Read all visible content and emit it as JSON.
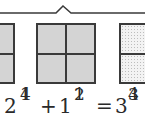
{
  "diagram": {
    "bracket": {
      "description": "brace grouping the three models"
    },
    "models": [
      {
        "id": "left",
        "parts": 4,
        "shading": "gray",
        "visible": "partial"
      },
      {
        "id": "middle",
        "parts": 4,
        "shading": "gray",
        "visible": "full"
      },
      {
        "id": "right",
        "parts": 2,
        "shading": "dotted",
        "visible": "partial"
      }
    ],
    "equation": {
      "term1_whole": "2",
      "term1_num": "1",
      "term1_den": "4",
      "plus": "+",
      "term2_whole": "1",
      "term2_num": "1",
      "term2_den": "2",
      "equals": "=",
      "result_whole": "3",
      "result_num": "3",
      "result_den": "4"
    }
  },
  "colors": {
    "stroke": "#3a3a3a",
    "fill_gray": "#d4d4d4",
    "fill_dotted_bg": "#f3f3f3"
  }
}
